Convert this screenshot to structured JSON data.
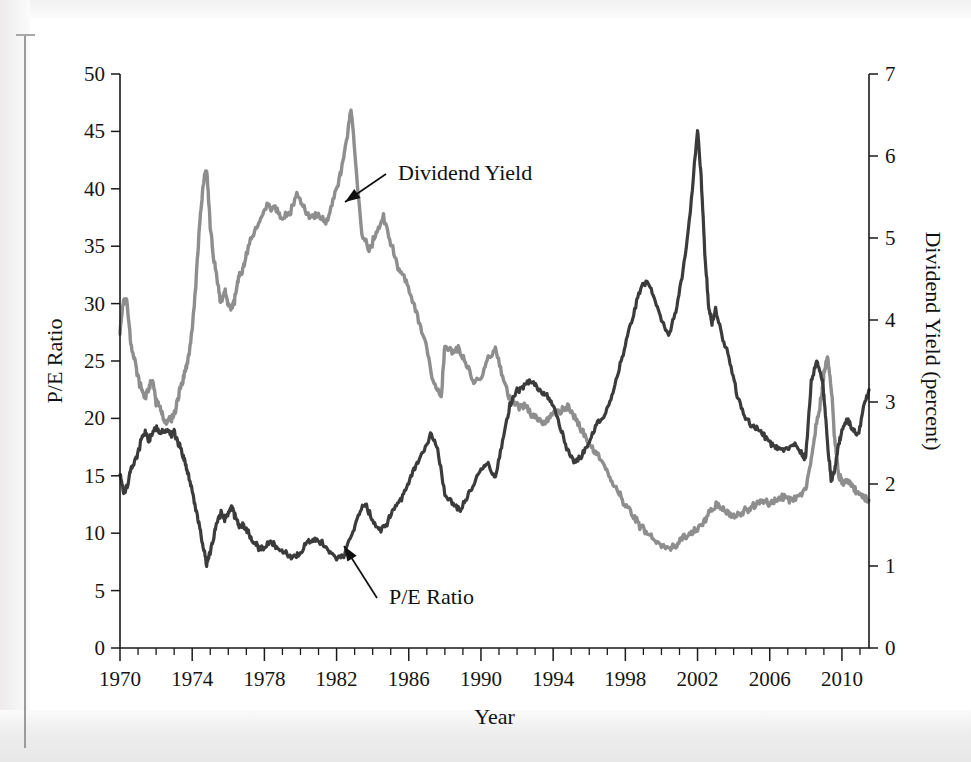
{
  "page": {
    "binding_rule": "vertical-page-edge-rule"
  },
  "chart_data": {
    "type": "line",
    "title": "",
    "xlabel": "Year",
    "ylabel": "P/E Ratio",
    "y2label": "Dividend Yield (percent)",
    "xlim": [
      1970,
      2011.5
    ],
    "ylim": [
      0,
      50
    ],
    "y2lim": [
      0,
      7
    ],
    "grid": false,
    "legend_position": "inline-annotations",
    "x_ticks_major": [
      1970,
      1974,
      1978,
      1982,
      1986,
      1990,
      1994,
      1998,
      2002,
      2006,
      2010
    ],
    "x_ticks_major_labels": [
      "1970",
      "1974",
      "1978",
      "1982",
      "1986",
      "1990",
      "1994",
      "1998",
      "2002",
      "2006",
      "2010"
    ],
    "x_ticks_minor_step": 1,
    "y_ticks": [
      0,
      5,
      10,
      15,
      20,
      25,
      30,
      35,
      40,
      45,
      50
    ],
    "y_ticks_labels": [
      "0",
      "5",
      "10",
      "15",
      "20",
      "25",
      "30",
      "35",
      "40",
      "45",
      "50"
    ],
    "y2_ticks": [
      0,
      1,
      2,
      3,
      4,
      5,
      6,
      7
    ],
    "y2_ticks_labels": [
      "0",
      "1",
      "2",
      "3",
      "4",
      "5",
      "6",
      "7"
    ],
    "annotations": [
      {
        "text": "Dividend Yield",
        "x": 1983.6,
        "y_axis": "right",
        "points_at_year": 1982.6
      },
      {
        "text": "P/E Ratio",
        "x": 1983.2,
        "y_axis": "left",
        "points_at_year": 1982.9
      }
    ],
    "series": [
      {
        "name": "P/E Ratio",
        "axis": "left",
        "color": "#3b3b3b",
        "unit": "ratio",
        "x": [
          1970.0,
          1970.2,
          1970.4,
          1970.6,
          1970.8,
          1971.0,
          1971.2,
          1971.4,
          1971.6,
          1971.8,
          1972.0,
          1972.2,
          1972.4,
          1972.6,
          1972.8,
          1973.0,
          1973.2,
          1973.4,
          1973.6,
          1973.8,
          1974.0,
          1974.2,
          1974.4,
          1974.6,
          1974.8,
          1975.0,
          1975.2,
          1975.4,
          1975.6,
          1975.8,
          1976.0,
          1976.2,
          1976.4,
          1976.6,
          1976.8,
          1977.0,
          1977.2,
          1977.4,
          1977.6,
          1977.8,
          1978.0,
          1978.4,
          1978.8,
          1979.2,
          1979.6,
          1980.0,
          1980.4,
          1980.8,
          1981.2,
          1981.6,
          1982.0,
          1982.4,
          1982.8,
          1983.2,
          1983.6,
          1984.0,
          1984.4,
          1984.8,
          1985.2,
          1985.6,
          1986.0,
          1986.4,
          1986.8,
          1987.2,
          1987.6,
          1988.0,
          1988.4,
          1988.8,
          1989.2,
          1989.6,
          1990.0,
          1990.4,
          1990.8,
          1991.2,
          1991.6,
          1992.0,
          1992.4,
          1992.8,
          1993.2,
          1993.6,
          1994.0,
          1994.4,
          1994.8,
          1995.2,
          1995.6,
          1996.0,
          1996.4,
          1996.8,
          1997.2,
          1997.6,
          1998.0,
          1998.4,
          1998.8,
          1999.2,
          1999.6,
          2000.0,
          2000.4,
          2000.8,
          2001.2,
          2001.6,
          2002.0,
          2002.2,
          2002.4,
          2002.6,
          2002.8,
          2003.0,
          2003.4,
          2003.8,
          2004.2,
          2004.6,
          2005.0,
          2005.4,
          2005.8,
          2006.2,
          2006.6,
          2007.0,
          2007.4,
          2007.8,
          2008.0,
          2008.3,
          2008.6,
          2008.9,
          2009.0,
          2009.2,
          2009.4,
          2009.6,
          2009.8,
          2010.0,
          2010.3,
          2010.6,
          2010.9,
          2011.2,
          2011.5
        ],
        "y": [
          15.2,
          13.5,
          14.0,
          15.6,
          16.3,
          17.0,
          18.3,
          18.8,
          18.2,
          18.6,
          19.2,
          18.7,
          18.9,
          19.0,
          18.6,
          18.9,
          18.0,
          17.2,
          16.1,
          15.0,
          13.8,
          12.2,
          10.5,
          8.9,
          7.3,
          8.4,
          9.8,
          11.0,
          11.8,
          11.2,
          11.8,
          12.1,
          11.4,
          10.6,
          10.7,
          10.3,
          9.7,
          9.2,
          8.9,
          8.6,
          8.8,
          9.3,
          8.6,
          8.2,
          7.9,
          8.3,
          9.2,
          9.4,
          9.1,
          8.4,
          7.8,
          8.1,
          9.6,
          11.6,
          12.6,
          11.0,
          10.2,
          10.9,
          12.3,
          13.0,
          14.5,
          15.9,
          17.0,
          18.6,
          17.3,
          13.4,
          12.6,
          12.0,
          13.0,
          14.3,
          15.4,
          16.1,
          14.8,
          18.0,
          21.2,
          22.4,
          22.8,
          23.3,
          22.6,
          22.1,
          21.0,
          19.3,
          17.2,
          16.1,
          16.8,
          18.0,
          19.4,
          20.1,
          21.7,
          23.9,
          26.5,
          28.9,
          31.2,
          32.0,
          30.4,
          28.6,
          27.1,
          29.4,
          32.8,
          38.0,
          45.2,
          41.0,
          34.5,
          30.0,
          28.2,
          29.5,
          27.0,
          25.0,
          22.0,
          20.2,
          19.3,
          19.0,
          18.3,
          17.6,
          17.3,
          17.4,
          17.8,
          16.8,
          16.6,
          23.2,
          25.0,
          23.5,
          22.0,
          18.0,
          14.5,
          15.5,
          17.5,
          19.0,
          20.0,
          19.0,
          18.5,
          21.0,
          22.5
        ]
      },
      {
        "name": "Dividend Yield",
        "axis": "right",
        "color": "#8e8e8e",
        "unit": "percent",
        "x": [
          1970.0,
          1970.2,
          1970.4,
          1970.6,
          1970.8,
          1971.0,
          1971.2,
          1971.4,
          1971.6,
          1971.8,
          1972.0,
          1972.2,
          1972.4,
          1972.6,
          1972.8,
          1973.0,
          1973.2,
          1973.4,
          1973.6,
          1973.8,
          1974.0,
          1974.2,
          1974.4,
          1974.6,
          1974.8,
          1975.0,
          1975.2,
          1975.4,
          1975.6,
          1975.8,
          1976.0,
          1976.2,
          1976.4,
          1976.6,
          1976.8,
          1977.0,
          1977.4,
          1977.8,
          1978.2,
          1978.6,
          1979.0,
          1979.4,
          1979.8,
          1980.2,
          1980.6,
          1981.0,
          1981.4,
          1981.8,
          1982.2,
          1982.4,
          1982.6,
          1982.8,
          1983.0,
          1983.4,
          1983.8,
          1984.2,
          1984.6,
          1985.0,
          1985.4,
          1985.8,
          1986.2,
          1986.6,
          1987.0,
          1987.4,
          1987.8,
          1988.0,
          1988.4,
          1988.8,
          1989.2,
          1989.6,
          1990.0,
          1990.4,
          1990.8,
          1991.2,
          1991.6,
          1992.0,
          1992.4,
          1992.8,
          1993.2,
          1993.6,
          1994.0,
          1994.4,
          1994.8,
          1995.2,
          1995.6,
          1996.0,
          1996.4,
          1996.8,
          1997.2,
          1997.6,
          1998.0,
          1998.4,
          1998.8,
          1999.2,
          1999.6,
          2000.0,
          2000.4,
          2000.8,
          2001.2,
          2001.6,
          2002.0,
          2002.4,
          2002.8,
          2003.2,
          2003.6,
          2004.0,
          2004.4,
          2004.8,
          2005.2,
          2005.6,
          2006.0,
          2006.4,
          2006.8,
          2007.2,
          2007.6,
          2008.0,
          2008.3,
          2008.6,
          2008.9,
          2009.0,
          2009.2,
          2009.4,
          2009.6,
          2009.8,
          2010.0,
          2010.3,
          2010.6,
          2010.9,
          2011.2,
          2011.5
        ],
        "y": [
          3.85,
          4.25,
          4.2,
          3.7,
          3.55,
          3.3,
          3.15,
          3.05,
          3.2,
          3.25,
          3.0,
          2.95,
          2.8,
          2.75,
          2.8,
          2.85,
          3.05,
          3.2,
          3.35,
          3.55,
          3.9,
          4.45,
          5.1,
          5.65,
          5.85,
          5.15,
          4.75,
          4.45,
          4.2,
          4.35,
          4.2,
          4.1,
          4.3,
          4.55,
          4.6,
          4.8,
          5.05,
          5.25,
          5.4,
          5.35,
          5.25,
          5.3,
          5.55,
          5.35,
          5.25,
          5.3,
          5.15,
          5.45,
          5.75,
          6.0,
          6.25,
          6.6,
          6.05,
          5.05,
          4.85,
          5.05,
          5.25,
          4.95,
          4.65,
          4.5,
          4.25,
          3.95,
          3.65,
          3.2,
          3.05,
          3.7,
          3.6,
          3.65,
          3.45,
          3.25,
          3.25,
          3.55,
          3.65,
          3.3,
          3.05,
          2.95,
          2.95,
          2.85,
          2.8,
          2.75,
          2.85,
          2.9,
          2.95,
          2.8,
          2.65,
          2.5,
          2.35,
          2.25,
          2.05,
          1.9,
          1.75,
          1.65,
          1.5,
          1.4,
          1.3,
          1.25,
          1.2,
          1.25,
          1.35,
          1.4,
          1.45,
          1.55,
          1.7,
          1.75,
          1.65,
          1.6,
          1.65,
          1.7,
          1.75,
          1.8,
          1.75,
          1.8,
          1.85,
          1.8,
          1.85,
          1.95,
          2.3,
          2.75,
          3.1,
          3.35,
          3.55,
          3.2,
          2.55,
          2.15,
          2.0,
          2.05,
          1.95,
          1.9,
          1.85,
          1.8
        ]
      }
    ]
  }
}
